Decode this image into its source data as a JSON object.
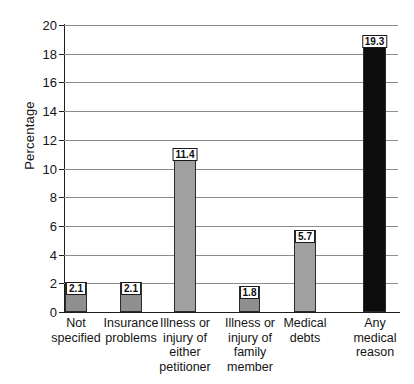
{
  "chart_data": {
    "type": "bar",
    "title": "",
    "xlabel": "",
    "ylabel": "Percentage",
    "ylim": [
      0,
      20
    ],
    "ytick_step": 2,
    "grid": true,
    "legend": "none",
    "categories": [
      "Not specified",
      "Insurance problems",
      "Illness or injury of either petitioner",
      "Illness or injury of family member",
      "Medical debts",
      "Any medical reason"
    ],
    "category_lines": [
      [
        "Not",
        "specified"
      ],
      [
        "Insurance",
        "problems"
      ],
      [
        "Illness or",
        "injury of",
        "either",
        "petitioner"
      ],
      [
        "Illness or",
        "injury of",
        "family",
        "member"
      ],
      [
        "Medical",
        "debts"
      ],
      [
        "Any",
        "medical",
        "reason"
      ]
    ],
    "values": [
      2.1,
      2.1,
      11.4,
      1.8,
      5.7,
      19.3
    ],
    "value_labels": [
      "2.1",
      "2.1",
      "11.4",
      "1.8",
      "5.7",
      "19.3"
    ],
    "yticks": [
      "0",
      "2",
      "4",
      "6",
      "8",
      "10",
      "12",
      "14",
      "16",
      "18",
      "20"
    ],
    "bar_colors": [
      "#8f8f8f",
      "#8f8f8f",
      "#a0a0a0",
      "#8f8f8f",
      "#a0a0a0",
      "#0d0d0d"
    ],
    "colors": {
      "gray_bar": "#9a9a9a",
      "black_bar": "#0d0d0d",
      "gridline": "#8c8c8c",
      "axis": "#1d1d1d",
      "text": "#141414",
      "label_box_bg": "#ffffff"
    },
    "bar_geometry": [
      {
        "left": 1,
        "width": 22
      },
      {
        "left": 56,
        "width": 22
      },
      {
        "left": 110,
        "width": 22
      },
      {
        "left": 175,
        "width": 21
      },
      {
        "left": 230,
        "width": 22
      },
      {
        "left": 299,
        "width": 23
      }
    ],
    "label_geometry": [
      {
        "left": -20,
        "width": 64
      },
      {
        "left": 34,
        "width": 66
      },
      {
        "left": 88,
        "width": 66
      },
      {
        "left": 153,
        "width": 66
      },
      {
        "left": 208,
        "width": 66
      },
      {
        "left": 278,
        "width": 66
      }
    ]
  }
}
